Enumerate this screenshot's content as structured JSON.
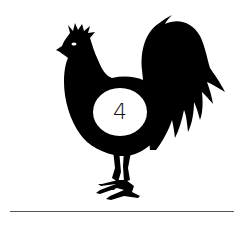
{
  "illustration": {
    "subject": "rooster-silhouette",
    "badge_number": "4",
    "colors": {
      "silhouette": "#000000",
      "background": "#ffffff",
      "badge_fill": "#ffffff",
      "ground_line": "#555555"
    }
  }
}
